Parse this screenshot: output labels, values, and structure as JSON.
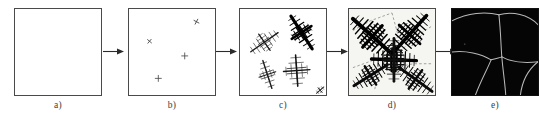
{
  "figure": {
    "panel_count": 5,
    "background_color": "#ffffff",
    "frame_color": "#4a4a4a",
    "arrow_color": "#2b2b2b",
    "label_color": "#3c3c3c"
  },
  "panels": [
    {
      "id": "a",
      "label": "a)",
      "caption": "liquid melt, no nuclei",
      "stage": "liquid",
      "fill": "#ffffff",
      "marks": []
    },
    {
      "id": "b",
      "label": "b)",
      "caption": "nucleation",
      "stage": "nucleation",
      "fill": "#ffffff",
      "marks": [
        {
          "x": 69,
          "y": 13,
          "size": 6.5,
          "rot": 28,
          "type": "cross"
        },
        {
          "x": 21,
          "y": 33,
          "size": 6.0,
          "rot": 40,
          "type": "cross"
        },
        {
          "x": 57,
          "y": 48,
          "size": 7.0,
          "rot": 0,
          "type": "plus"
        },
        {
          "x": 30,
          "y": 71,
          "size": 7.0,
          "rot": 0,
          "type": "plus"
        }
      ]
    },
    {
      "id": "c",
      "label": "c)",
      "caption": "dendritic growth of crystals",
      "stage": "growth",
      "fill": "#ffffff",
      "dendrites": [
        {
          "cx": 25,
          "cy": 34,
          "len": 34,
          "rot": -35,
          "branch": 9,
          "n": 7,
          "w": 1.5,
          "color": "#1c1c1c"
        },
        {
          "cx": 63,
          "cy": 24,
          "len": 40,
          "rot": 57,
          "branch": 10,
          "n": 8,
          "w": 3.2,
          "color": "#000000"
        },
        {
          "cx": 28,
          "cy": 67,
          "len": 30,
          "rot": 72,
          "branch": 7,
          "n": 6,
          "w": 1.4,
          "color": "#1c1c1c"
        },
        {
          "cx": 58,
          "cy": 63,
          "len": 32,
          "rot": 86,
          "branch": 11,
          "n": 6,
          "w": 1.6,
          "color": "#141414"
        },
        {
          "cx": 82,
          "cy": 83,
          "len": 10,
          "rot": -40,
          "branch": 3,
          "n": 3,
          "w": 1.0,
          "color": "#2a2a2a"
        }
      ]
    },
    {
      "id": "d",
      "label": "d)",
      "caption": "grains impinge, boundaries form",
      "stage": "impingement",
      "fill": "#f5f5f2",
      "dendrites": [
        {
          "cx": 24,
          "cy": 28,
          "len": 54,
          "rot": 42,
          "branch": 15,
          "n": 11,
          "w": 4.0,
          "color": "#000000"
        },
        {
          "cx": 62,
          "cy": 26,
          "len": 52,
          "rot": -48,
          "branch": 14,
          "n": 11,
          "w": 3.6,
          "color": "#000000"
        },
        {
          "cx": 46,
          "cy": 52,
          "len": 46,
          "rot": 2,
          "branch": 13,
          "n": 10,
          "w": 3.4,
          "color": "#000000"
        },
        {
          "cx": 22,
          "cy": 68,
          "len": 40,
          "rot": -32,
          "branch": 11,
          "n": 9,
          "w": 3.0,
          "color": "#0a0a0a"
        },
        {
          "cx": 68,
          "cy": 72,
          "len": 42,
          "rot": 36,
          "branch": 12,
          "n": 9,
          "w": 3.0,
          "color": "#0a0a0a"
        },
        {
          "cx": 46,
          "cy": 52,
          "len": 44,
          "rot": 90,
          "branch": 12,
          "n": 9,
          "w": 2.8,
          "color": "#101010"
        }
      ],
      "boundaries": [
        "M 4 22 L 22 12 L 44 4",
        "M 44 4 L 50 26 L 46 46",
        "M 84 18 L 66 30 L 52 44",
        "M 4 60 L 26 52 L 46 48",
        "M 46 48 L 58 62 L 62 84",
        "M 46 48 L 30 64 L 26 84",
        "M 84 56 L 66 56 L 56 58"
      ]
    },
    {
      "id": "e",
      "label": "e)",
      "caption": "final polycrystalline grain structure",
      "stage": "grains",
      "fill": "#050505",
      "boundary_color": "#b9b9b9",
      "grain_boundaries": [
        "M 0 12 C 16 4 34 2 48 6",
        "M 48 6 C 62 2 78 6 88 16",
        "M 48 6 C 50 24 50 38 51 49",
        "M 0 44 C 14 42 30 46 40 52",
        "M 40 52 C 46 50 49 50 51 49",
        "M 51 49 C 60 54 70 56 88 54",
        "M 40 52 C 36 62 30 72 24 88",
        "M 51 49 C 52 62 54 74 55 88",
        "M 88 54 C 78 62 72 72 70 88"
      ]
    }
  ],
  "arrows": [
    {
      "id": "arrow-a-b",
      "from": "a",
      "to": "b",
      "direction": "right"
    },
    {
      "id": "arrow-b-c",
      "from": "b",
      "to": "c",
      "direction": "right"
    },
    {
      "id": "arrow-c-d",
      "from": "c",
      "to": "d",
      "direction": "right"
    },
    {
      "id": "arrow-d-e",
      "from": "d",
      "to": "e",
      "direction": "right"
    }
  ]
}
